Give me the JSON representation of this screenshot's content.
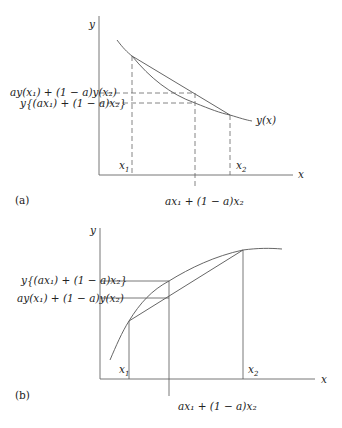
{
  "panel_a": {
    "label": "(a)",
    "y_axis_label": "y",
    "x_axis_label": "x",
    "curve_label": "y(x)",
    "x1_label": "x",
    "x1_sub": "1",
    "x2_label": "x",
    "x2_sub": "2",
    "chord_value_label": "ay(x₁) + (1 − a)y(x₂)",
    "curve_value_label": "y{(ax₁) + (1 − a)x₂}",
    "mid_x_label": "ax₁ + (1 − a)x₂",
    "description": "Convex decreasing curve; chord lies above the curve"
  },
  "panel_b": {
    "label": "(b)",
    "y_axis_label": "y",
    "x_axis_label": "x",
    "x1_label": "x",
    "x1_sub": "1",
    "x2_label": "x",
    "x2_sub": "2",
    "curve_value_label": "y{(ax₁) + (1 − a)x₂}",
    "chord_value_label": "ay(x₁) + (1 − a)y(x₂)",
    "mid_x_label": "ax₁ + (1 − a)x₂",
    "description": "Concave increasing curve; chord lies below the curve"
  }
}
